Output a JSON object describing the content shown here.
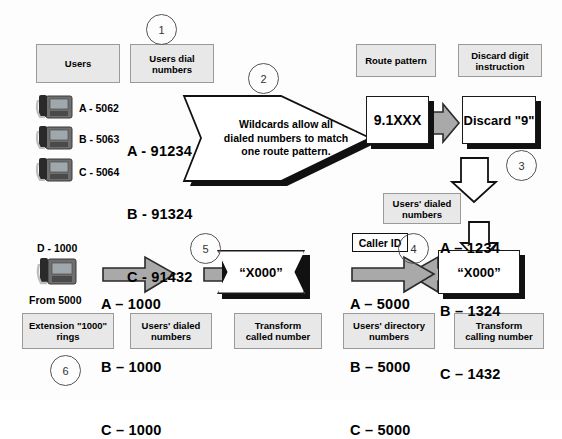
{
  "diagram": {
    "colors": {
      "label_box_fill": "#e8e8e8",
      "label_box_border": "#9a9a9a",
      "white_box_fill": "#ffffff",
      "box_border": "#1a1a1a",
      "shadow": "#111111",
      "gray_arrow_fill": "#a9a9a9",
      "gray_arrow_border": "#2a2a2a",
      "hollow_arrow_fill": "#ffffff",
      "circle_border": "#555555",
      "background": "#fdfdfd"
    }
  },
  "steps": {
    "one": "1",
    "two": "2",
    "three": "3",
    "four": "4",
    "five": "5",
    "six": "6"
  },
  "labels": {
    "users": "Users",
    "users_dial_numbers": "Users dial\nnumbers",
    "route_pattern": "Route pattern",
    "discard_digit_instruction": "Discard digit\ninstruction",
    "users_dialed_numbers_top": "Users' dialed\nnumbers",
    "users_directory_numbers": "Users' directory\nnumbers",
    "transform_calling_number": "Transform\ncalling number",
    "transform_called_number": "Transform\ncalled number",
    "users_dialed_numbers_bottom": "Users' dialed\nnumbers",
    "extension_rings": "Extension \"1000\"\nrings",
    "caller_id": "Caller ID"
  },
  "users": {
    "list": [
      {
        "name": "A - 5062",
        "icon": "ip-phone-icon"
      },
      {
        "name": "B - 5063",
        "icon": "ip-phone-icon"
      },
      {
        "name": "C - 5064",
        "icon": "ip-phone-icon"
      }
    ]
  },
  "dialed_numbers": {
    "lines": [
      "A - 91234",
      "B - 91324",
      "C - 91432"
    ]
  },
  "banner": {
    "text": "Wildcards allow all\ndialed numbers to match\none route pattern."
  },
  "boxes": {
    "route_pattern_value": "9.1XXX",
    "discard_value": "Discard \"9\"",
    "transform_calling_value": "“X000”",
    "transform_called_value": "“X000”"
  },
  "after_discard": {
    "lines": [
      "A – 1234",
      "B – 1324",
      "C – 1432"
    ]
  },
  "caller_id_numbers": {
    "lines": [
      "A – 5000",
      "B – 5000",
      "C – 5000"
    ]
  },
  "transformed_called": {
    "lines": [
      "A – 1000",
      "B – 1000",
      "C – 1000"
    ]
  },
  "destination": {
    "extension": "D - 1000",
    "from": "From 5000",
    "icon": "ip-phone-icon"
  }
}
